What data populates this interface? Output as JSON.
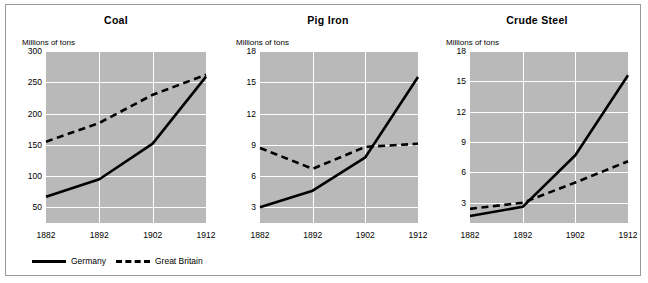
{
  "figure": {
    "unit_label": "Millions of tons",
    "background_color": "#b9b9b9",
    "gridline_color": "#ffffff",
    "line_color": "#000000",
    "legend": {
      "germany_label": "Germany",
      "britain_label": "Great Britain"
    }
  },
  "chart_data": [
    {
      "type": "line",
      "title": "Coal",
      "xlabel": "",
      "ylabel": "Millions of tons",
      "x": [
        1882,
        1892,
        1902,
        1912
      ],
      "xticks": [
        "1882",
        "1892",
        "1902",
        "1912"
      ],
      "yticks": [
        50,
        100,
        150,
        200,
        250,
        300
      ],
      "ytick_labels": [
        "50",
        "100",
        "150",
        "200",
        "250",
        "300"
      ],
      "ylim": [
        25,
        300
      ],
      "xlim": [
        1882,
        1912
      ],
      "grid": true,
      "legend_position": "below-figure",
      "series": [
        {
          "name": "Germany",
          "style": "solid",
          "values": [
            67,
            95,
            152,
            259
          ]
        },
        {
          "name": "Great Britain",
          "style": "dashed",
          "values": [
            155,
            185,
            230,
            262
          ]
        }
      ]
    },
    {
      "type": "line",
      "title": "Pig Iron",
      "xlabel": "",
      "ylabel": "Millions of tons",
      "x": [
        1882,
        1892,
        1902,
        1912
      ],
      "xticks": [
        "1882",
        "1892",
        "1902",
        "1912"
      ],
      "yticks": [
        3,
        6,
        9,
        12,
        15,
        18
      ],
      "ytick_labels": [
        "3",
        "6",
        "9",
        "12",
        "15",
        "18"
      ],
      "ylim": [
        1.5,
        18
      ],
      "xlim": [
        1882,
        1912
      ],
      "grid": true,
      "legend_position": "below-figure",
      "series": [
        {
          "name": "Germany",
          "style": "solid",
          "values": [
            3.0,
            4.6,
            7.8,
            15.5
          ]
        },
        {
          "name": "Great Britain",
          "style": "dashed",
          "values": [
            8.7,
            6.7,
            8.8,
            9.1
          ]
        }
      ]
    },
    {
      "type": "line",
      "title": "Crude Steel",
      "xlabel": "",
      "ylabel": "Millions of tons",
      "x": [
        1882,
        1892,
        1902,
        1912
      ],
      "xticks": [
        "1882",
        "1892",
        "1902",
        "1912"
      ],
      "yticks": [
        3,
        6,
        9,
        12,
        15,
        18
      ],
      "ytick_labels": [
        "3",
        "6",
        "9",
        "12",
        "15",
        "18"
      ],
      "ylim": [
        1.0,
        18
      ],
      "xlim": [
        1882,
        1912
      ],
      "grid": true,
      "legend_position": "below-figure",
      "series": [
        {
          "name": "Germany",
          "style": "solid",
          "values": [
            1.7,
            2.6,
            7.7,
            15.6
          ]
        },
        {
          "name": "Great Britain",
          "style": "dashed",
          "values": [
            2.4,
            3.0,
            5.0,
            7.1
          ]
        }
      ]
    }
  ]
}
